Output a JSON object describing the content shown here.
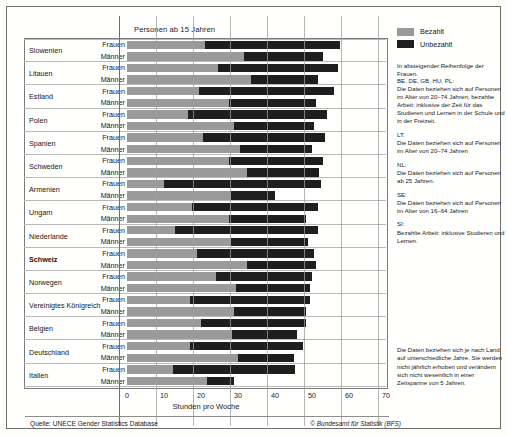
{
  "chart_title": "Personen ab 15 Jahren",
  "axis": {
    "xlabel": "Stunden pro Woche",
    "ticks": [
      0,
      10,
      20,
      30,
      40,
      50,
      60,
      70
    ],
    "xlim": [
      0,
      70
    ]
  },
  "legend": {
    "items": [
      {
        "label": "Bezahlt",
        "color": "#9a9a9a",
        "key": "paid"
      },
      {
        "label": "Unbezahlt",
        "color": "#1e1e1e",
        "key": "unpaid"
      }
    ]
  },
  "order_note": "In absteigender Reihenfolge der Frauen.",
  "notes": [
    {
      "head": "BE, DE, GB, HU, PL:",
      "body": "Die Daten beziehen sich auf Personen im Alter von 20–74 Jahren; bezahlte Arbeit: inklusive der Zeit für das Studieren und Lernen in der Schule und in der Freizeit."
    },
    {
      "head": "LT:",
      "body": "Die Daten beziehen sich auf Personen im Alter von 20–74 Jahren"
    },
    {
      "head": "NL:",
      "body": "Die Daten beziehen sich auf Personen ab 25 Jahren."
    },
    {
      "head": "SE:",
      "body": "Die Daten beziehen sich auf Personen im Alter von 16–64 Jahren"
    },
    {
      "head": "SI:",
      "body": "Bezahlte Arbeit: inklusive Studieren und Lernen."
    }
  ],
  "bottom_note": "Die Daten beziehen sich je nach Land auf unterschiedliche Jahre. Sie werden nicht jährlich erhoben und verändern sich nicht wesentlich in einer Zeitspanne von 5 Jahren.",
  "source": "Quelle: UNECE Gender Statistics Database",
  "copyright": "© Bundesamt für Statistik (BFS)",
  "series_labels": {
    "women": "Frauen",
    "men": "Männer"
  },
  "chart_data": {
    "type": "bar",
    "orientation": "horizontal",
    "stacked": true,
    "title": "Personen ab 15 Jahren",
    "xlabel": "Stunden pro Woche",
    "ylabel": "",
    "xlim": [
      0,
      70
    ],
    "xticks": [
      0,
      10,
      20,
      30,
      40,
      50,
      60,
      70
    ],
    "grid": "vertical",
    "legend_position": "right-top",
    "series": [
      {
        "name": "Bezahlt",
        "color": "#9a9a9a"
      },
      {
        "name": "Unbezahlt",
        "color": "#1e1e1e"
      }
    ],
    "categories": [
      "Slowenien",
      "Litauen",
      "Estland",
      "Polen",
      "Spanien",
      "Schweden",
      "Armenien",
      "Ungarn",
      "Niederlande",
      "Schweiz",
      "Norwegen",
      "Vereinigtes Königreich",
      "Belgien",
      "Deutschland",
      "Italien"
    ],
    "rows": [
      {
        "country": "Slowenien",
        "sex": "Frauen",
        "paid": 21.0,
        "unpaid": 36.5,
        "total": 57.5
      },
      {
        "country": "Slowenien",
        "sex": "Männer",
        "paid": 31.5,
        "unpaid": 21.5,
        "total": 53.0
      },
      {
        "country": "Litauen",
        "sex": "Frauen",
        "paid": 24.5,
        "unpaid": 32.5,
        "total": 57.0
      },
      {
        "country": "Litauen",
        "sex": "Männer",
        "paid": 33.5,
        "unpaid": 18.0,
        "total": 51.5
      },
      {
        "country": "Estland",
        "sex": "Frauen",
        "paid": 19.5,
        "unpaid": 36.5,
        "total": 56.0
      },
      {
        "country": "Estland",
        "sex": "Männer",
        "paid": 27.5,
        "unpaid": 23.5,
        "total": 51.0
      },
      {
        "country": "Polen",
        "sex": "Frauen",
        "paid": 16.5,
        "unpaid": 37.5,
        "total": 54.0
      },
      {
        "country": "Polen",
        "sex": "Männer",
        "paid": 29.0,
        "unpaid": 21.5,
        "total": 50.5
      },
      {
        "country": "Spanien",
        "sex": "Frauen",
        "paid": 20.5,
        "unpaid": 33.0,
        "total": 53.5
      },
      {
        "country": "Spanien",
        "sex": "Männer",
        "paid": 30.5,
        "unpaid": 19.5,
        "total": 50.0
      },
      {
        "country": "Schweden",
        "sex": "Frauen",
        "paid": 27.5,
        "unpaid": 25.5,
        "total": 53.0
      },
      {
        "country": "Schweden",
        "sex": "Männer",
        "paid": 32.5,
        "unpaid": 19.5,
        "total": 52.0
      },
      {
        "country": "Armenien",
        "sex": "Frauen",
        "paid": 10.0,
        "unpaid": 42.5,
        "total": 52.5
      },
      {
        "country": "Armenien",
        "sex": "Männer",
        "paid": 28.0,
        "unpaid": 12.0,
        "total": 40.0
      },
      {
        "country": "Ungarn",
        "sex": "Frauen",
        "paid": 17.5,
        "unpaid": 34.0,
        "total": 51.5
      },
      {
        "country": "Ungarn",
        "sex": "Männer",
        "paid": 27.5,
        "unpaid": 21.0,
        "total": 48.5
      },
      {
        "country": "Niederlande",
        "sex": "Frauen",
        "paid": 13.0,
        "unpaid": 38.5,
        "total": 51.5
      },
      {
        "country": "Niederlande",
        "sex": "Männer",
        "paid": 28.0,
        "unpaid": 21.0,
        "total": 49.0
      },
      {
        "country": "Schweiz",
        "sex": "Frauen",
        "paid": 19.0,
        "unpaid": 31.5,
        "total": 50.5
      },
      {
        "country": "Schweiz",
        "sex": "Männer",
        "paid": 32.5,
        "unpaid": 18.5,
        "total": 51.0
      },
      {
        "country": "Norwegen",
        "sex": "Frauen",
        "paid": 24.0,
        "unpaid": 26.0,
        "total": 50.0
      },
      {
        "country": "Norwegen",
        "sex": "Männer",
        "paid": 29.5,
        "unpaid": 20.0,
        "total": 49.5
      },
      {
        "country": "Vereinigtes Königreich",
        "sex": "Frauen",
        "paid": 17.0,
        "unpaid": 32.5,
        "total": 49.5
      },
      {
        "country": "Vereinigtes Königreich",
        "sex": "Männer",
        "paid": 29.0,
        "unpaid": 19.5,
        "total": 48.5
      },
      {
        "country": "Belgien",
        "sex": "Frauen",
        "paid": 20.0,
        "unpaid": 28.5,
        "total": 48.5
      },
      {
        "country": "Belgien",
        "sex": "Männer",
        "paid": 28.5,
        "unpaid": 17.5,
        "total": 46.0
      },
      {
        "country": "Deutschland",
        "sex": "Frauen",
        "paid": 17.0,
        "unpaid": 30.5,
        "total": 47.5
      },
      {
        "country": "Deutschland",
        "sex": "Männer",
        "paid": 30.0,
        "unpaid": 15.0,
        "total": 45.0
      },
      {
        "country": "Italien",
        "sex": "Frauen",
        "paid": 12.5,
        "unpaid": 33.0,
        "total": 45.5
      },
      {
        "country": "Italien",
        "sex": "Männer",
        "paid": 21.5,
        "unpaid": 7.5,
        "total": 29.0
      }
    ]
  }
}
